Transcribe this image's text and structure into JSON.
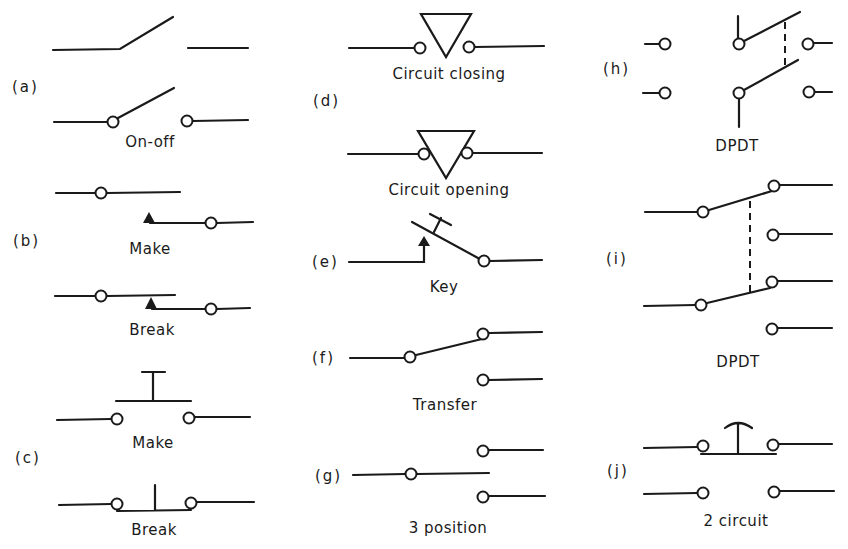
{
  "figure": {
    "groups": [
      {
        "tag": "(a)",
        "captions": [
          "On-off"
        ]
      },
      {
        "tag": "(b)",
        "captions": [
          "Make",
          "Break"
        ]
      },
      {
        "tag": "(c)",
        "captions": [
          "Make",
          "Break"
        ]
      },
      {
        "tag": "(d)",
        "captions": [
          "Circuit closing",
          "Circuit opening"
        ]
      },
      {
        "tag": "(e)",
        "captions": [
          "Key"
        ]
      },
      {
        "tag": "(f)",
        "captions": [
          "Transfer"
        ]
      },
      {
        "tag": "(g)",
        "captions": [
          "3 position"
        ]
      },
      {
        "tag": "(h)",
        "captions": [
          "DPDT"
        ]
      },
      {
        "tag": "(i)",
        "captions": [
          "DPDT"
        ]
      },
      {
        "tag": "(j)",
        "captions": [
          "2 circuit"
        ]
      }
    ],
    "line_color": "#1a1a1a",
    "background": "#ffffff"
  }
}
